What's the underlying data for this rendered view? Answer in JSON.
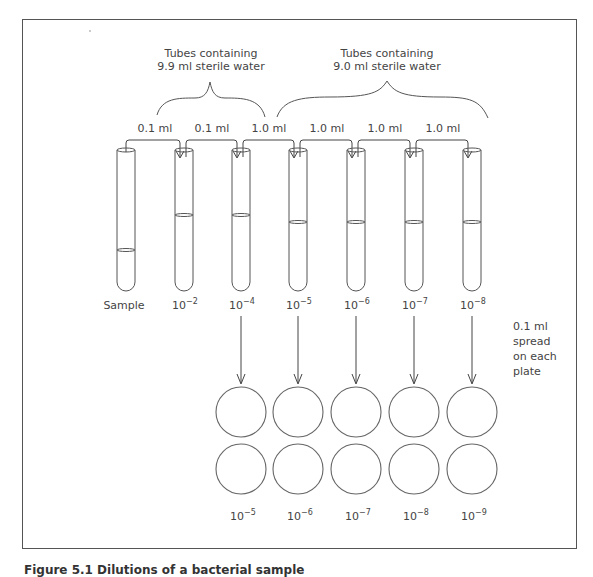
{
  "figure": {
    "caption": "Figure 5.1  Dilutions of a bacterial sample",
    "group_labels": {
      "left": {
        "line1": "Tubes containing",
        "line2": "9.9 ml sterile water"
      },
      "right": {
        "line1": "Tubes containing",
        "line2": "9.0 ml sterile water"
      }
    },
    "transfer_volumes": [
      "0.1 ml",
      "0.1 ml",
      "1.0 ml",
      "1.0 ml",
      "1.0 ml",
      "1.0 ml"
    ],
    "tubes": [
      {
        "label_base": "Sample",
        "label_exp": ""
      },
      {
        "label_base": "10",
        "label_exp": "−2"
      },
      {
        "label_base": "10",
        "label_exp": "−4"
      },
      {
        "label_base": "10",
        "label_exp": "−5"
      },
      {
        "label_base": "10",
        "label_exp": "−6"
      },
      {
        "label_base": "10",
        "label_exp": "−7"
      },
      {
        "label_base": "10",
        "label_exp": "−8"
      }
    ],
    "plating_note": {
      "line1": "0.1 ml",
      "line2": "spread",
      "line3": "on each",
      "line4": "plate"
    },
    "plate_dilutions": [
      {
        "base": "10",
        "exp": "−5"
      },
      {
        "base": "10",
        "exp": "−6"
      },
      {
        "base": "10",
        "exp": "−7"
      },
      {
        "base": "10",
        "exp": "−8"
      },
      {
        "base": "10",
        "exp": "−9"
      }
    ]
  }
}
